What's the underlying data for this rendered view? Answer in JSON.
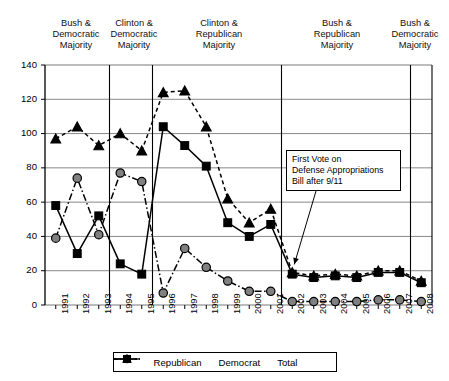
{
  "chart_data": {
    "type": "line",
    "title": "",
    "xlabel": "",
    "ylabel": "",
    "ylim": [
      0,
      140
    ],
    "ytick_step": 20,
    "grid": true,
    "legend_position": "bottom",
    "categories": [
      "1991",
      "1992",
      "1993",
      "1994",
      "1995",
      "1996",
      "1997",
      "1998",
      "1999",
      "2000",
      "2001",
      "2002",
      "2003",
      "2004",
      "2005",
      "2006",
      "2007",
      "2008"
    ],
    "yticks": [
      "0",
      "20",
      "40",
      "60",
      "80",
      "100",
      "120",
      "140"
    ],
    "series": [
      {
        "name": "Republican",
        "marker": "circle",
        "line_style": "dash-dot",
        "color": "#808080",
        "values": [
          39,
          74,
          41,
          77,
          72,
          7,
          33,
          22,
          14,
          8,
          8,
          2,
          2,
          2,
          2,
          3,
          3,
          2
        ]
      },
      {
        "name": "Democrat",
        "marker": "square",
        "line_style": "solid",
        "color": "#000000",
        "values": [
          58,
          30,
          52,
          24,
          18,
          104,
          93,
          81,
          48,
          40,
          47,
          18,
          16,
          17,
          16,
          19,
          19,
          13
        ]
      },
      {
        "name": "Total",
        "marker": "triangle",
        "line_style": "dashed",
        "color": "#000000",
        "values": [
          97,
          104,
          93,
          100,
          90,
          124,
          125,
          104,
          62,
          48,
          56,
          19,
          17,
          18,
          17,
          20,
          20,
          14
        ]
      }
    ],
    "annotations": [
      {
        "id": "first-vote-note",
        "lines": [
          "First Vote on",
          "Defense Appropriations",
          "Bill after 9/11"
        ],
        "points_to_category": "2002"
      }
    ],
    "era_bands": [
      {
        "label_lines": [
          "Bush &",
          "Democratic",
          "Majority"
        ],
        "start": "1991",
        "end": "1993"
      },
      {
        "label_lines": [
          "Clinton &",
          "Democratic",
          "Majority"
        ],
        "start": "1994",
        "end": "1995"
      },
      {
        "label_lines": [
          "Clinton &",
          "Republican",
          "Majority"
        ],
        "start": "1996",
        "end": "2001"
      },
      {
        "label_lines": [
          "Bush &",
          "Republican",
          "Majority"
        ],
        "start": "2002",
        "end": "2007"
      },
      {
        "label_lines": [
          "Bush &",
          "Democratic",
          "Majority"
        ],
        "start": "2008",
        "end": "2008"
      }
    ]
  },
  "legend": {
    "items": [
      {
        "label": "Republican"
      },
      {
        "label": "Democrat"
      },
      {
        "label": "Total"
      }
    ]
  }
}
